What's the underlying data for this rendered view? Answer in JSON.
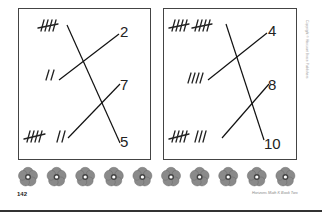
{
  "page": {
    "page_number": "142",
    "footer_credit": "Horizons Math K Book Two",
    "copyright": "Copyright © Harcourt Brace Publishers"
  },
  "exercises": [
    {
      "name": "left-matching-box",
      "tallies": [
        {
          "text": "̸IIII",
          "value": 5
        },
        {
          "text": "II",
          "value": 2
        },
        {
          "text": "̸IIII II",
          "value": 7
        }
      ],
      "numbers": [
        "2",
        "7",
        "5"
      ],
      "matches": [
        {
          "tally": 5,
          "number": "5"
        },
        {
          "tally": 2,
          "number": "2"
        },
        {
          "tally": 7,
          "number": "7"
        }
      ]
    },
    {
      "name": "right-matching-box",
      "tallies": [
        {
          "text": "̸IIII ̸IIII",
          "value": 10
        },
        {
          "text": "IIII",
          "value": 4
        },
        {
          "text": "̸IIII III",
          "value": 8
        }
      ],
      "numbers": [
        "4",
        "8",
        "10"
      ],
      "matches": [
        {
          "tally": 10,
          "number": "10"
        },
        {
          "tally": 4,
          "number": "4"
        },
        {
          "tally": 8,
          "number": "8"
        }
      ]
    }
  ],
  "decorations": {
    "flower_count": 10,
    "flower_petal_color": "#8a8a8a",
    "flower_center_color": "#ffffff"
  }
}
